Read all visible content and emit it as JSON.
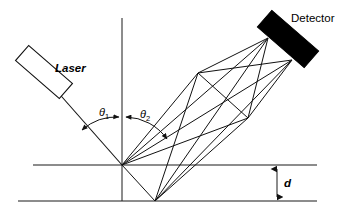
{
  "figure": {
    "type": "optical-scattering-diagram",
    "background_color": "#ffffff",
    "line_color": "#111111"
  },
  "labels": {
    "laser": "Laser",
    "detector": "Detector",
    "theta1": "θ",
    "theta1_sub": "1",
    "theta2": "θ",
    "theta2_sub": "2",
    "thickness": "d"
  },
  "components": {
    "laser": {
      "name": "Laser",
      "fill": "#ffffff",
      "stroke": "#111111",
      "center_x": 44,
      "center_y": 72,
      "width": 58,
      "height": 20,
      "rotation_deg": 41
    },
    "detector": {
      "name": "Detector",
      "fill": "#000000",
      "stroke": "#000000",
      "center_x": 288,
      "center_y": 39,
      "width": 62,
      "height": 22,
      "rotation_deg": 41
    }
  },
  "geometry": {
    "origin": {
      "x": 122,
      "y": 165
    },
    "bottom_node": {
      "x": 155,
      "y": 201
    },
    "node_upper": {
      "x": 198,
      "y": 73
    },
    "node_lower": {
      "x": 248,
      "y": 118
    },
    "detector_port_a": {
      "x": 268,
      "y": 38
    },
    "detector_port_b": {
      "x": 292,
      "y": 60
    },
    "top_surface": {
      "x1": 33,
      "y": 165,
      "x2": 317
    },
    "bottom_surface": {
      "x1": 18,
      "y": 201,
      "x2": 317
    },
    "normal_line": {
      "x": 122,
      "y1": 18,
      "y2": 201
    },
    "incident_beam": {
      "x1": 58,
      "y1": 92,
      "x2": 122,
      "y2": 165
    },
    "thickness_arrow": {
      "x": 277,
      "y_top": 167,
      "y_bottom": 199
    }
  }
}
